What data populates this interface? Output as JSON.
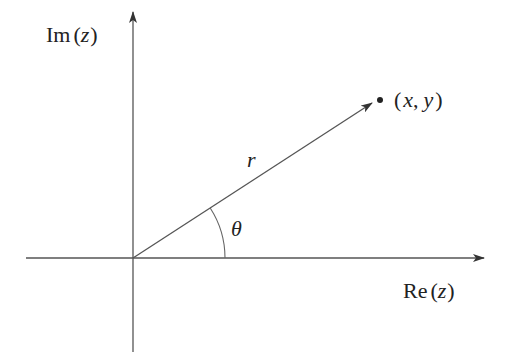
{
  "diagram": {
    "type": "complex-plane-polar",
    "colors": {
      "stroke": "#444444",
      "text": "#222222",
      "background": "#ffffff"
    },
    "axes": {
      "x_label_prefix": "Re",
      "x_label_var": "z",
      "y_label_prefix": "Im",
      "y_label_var": "z",
      "open_paren": "(",
      "close_paren": ")"
    },
    "point": {
      "label_open": "(",
      "label_x": "x",
      "label_comma": ",",
      "label_y": "y",
      "label_close": ")"
    },
    "vector": {
      "label": "r"
    },
    "angle": {
      "label": "θ"
    }
  }
}
